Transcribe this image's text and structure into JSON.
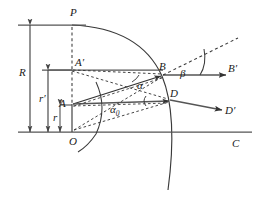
{
  "figure": {
    "type": "geometric-ray-diagram",
    "background_color": "#ffffff",
    "stroke_color": "#333333",
    "label_color": "#1a1a1a"
  },
  "labels": {
    "P": "P",
    "A_prime": "A′",
    "A": "A",
    "O": "O",
    "B": "B",
    "B_prime": "B′",
    "D": "D",
    "D_prime": "D′",
    "C": "C",
    "R": "R",
    "r_prime": "r′",
    "r": "r",
    "alpha": "α",
    "alpha_0_base": "α",
    "alpha_0_sub": "0",
    "beta": "β"
  },
  "points": {
    "P": {
      "x": 72,
      "y": 25,
      "label_dx": -2,
      "label_dy": -14
    },
    "A_prime": {
      "x": 72,
      "y": 70,
      "label_dx": 3,
      "label_dy": -13
    },
    "A": {
      "x": 72,
      "y": 105,
      "label_dx": -13,
      "label_dy": -5
    },
    "O": {
      "x": 72,
      "y": 132,
      "label_dx": -3,
      "label_dy": 13
    },
    "B": {
      "x": 163,
      "y": 75,
      "label_dx": -2,
      "label_dy": -8
    },
    "D": {
      "x": 170,
      "y": 100,
      "label_dx": 2,
      "label_dy": -8
    },
    "B_prime_end": {
      "x": 226,
      "y": 75
    },
    "D_prime_end": {
      "x": 222,
      "y": 110
    },
    "dash_up_end": {
      "x": 238,
      "y": 38
    }
  },
  "lines": {
    "top_horizontal": {
      "x1": 18,
      "y1": 25,
      "x2": 85,
      "y2": 25,
      "style": "solid"
    },
    "bottom_horizontal": {
      "x1": 18,
      "y1": 132,
      "x2": 252,
      "y2": 132,
      "style": "solid"
    },
    "mid_horizontal_Aprime": {
      "x1": 42,
      "y1": 70,
      "x2": 163,
      "y2": 70,
      "style": "solid"
    },
    "axis_A_to_D": {
      "x1": 72,
      "y1": 105,
      "x2": 170,
      "y2": 100,
      "style": "solid-arrow"
    }
  },
  "measure_arrows": [
    {
      "name": "R",
      "x": 30,
      "y1": 25,
      "y2": 132,
      "label_x": 22,
      "label_y": 72
    },
    {
      "name": "r_prime",
      "x": 48,
      "y1": 70,
      "y2": 132,
      "label_x": 40,
      "label_y": 98
    },
    {
      "name": "r",
      "x": 60,
      "y1": 105,
      "y2": 132,
      "label_x": 53,
      "label_y": 116
    }
  ],
  "angles": {
    "alpha": {
      "label_x": 121,
      "label_y": 84
    },
    "alpha_0": {
      "label_x": 101,
      "label_y": 110
    },
    "beta": {
      "label_x": 183,
      "label_y": 75
    }
  },
  "arcs": {
    "main_sphere": {
      "center_x": 18,
      "center_y": 130,
      "radius": 151,
      "note": "large circular surface through P and below O"
    },
    "small_arc_at_A": {
      "center_x": 72,
      "center_y": 105,
      "radius": 32,
      "note": "arc centered at A sweeping past O"
    },
    "beta_arc": {
      "center_x": 200,
      "center_y": 75,
      "radius": 27,
      "note": "angle arc for beta at vertex on B-B' axis"
    },
    "alpha_arc": {
      "note": "small arc at B between incident ray and axis"
    },
    "alpha0_arc": {
      "note": "small arc at D between axis and ray"
    }
  }
}
